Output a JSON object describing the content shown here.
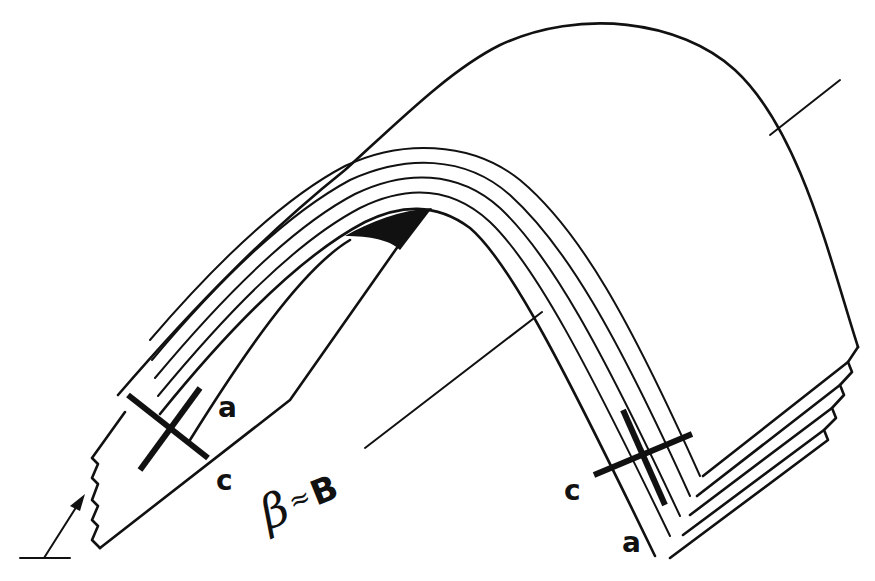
{
  "figure": {
    "labels": {
      "left_a": "a",
      "left_c": "c",
      "right_c": "c",
      "right_a": "a",
      "beta": "β",
      "approx": "≈",
      "b_axis": "B"
    },
    "colors": {
      "line": "#111111",
      "background": "#ffffff"
    },
    "layer_count": 5
  }
}
